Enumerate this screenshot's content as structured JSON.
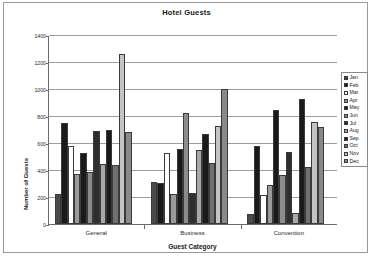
{
  "chart_data": {
    "type": "bar",
    "title": "Hotel Guests",
    "xlabel": "Guest Category",
    "ylabel": "Number of Guests",
    "categories": [
      "General",
      "Business",
      "Convention"
    ],
    "ylim": [
      0,
      1400
    ],
    "yticks": [
      0,
      200,
      400,
      600,
      800,
      1000,
      1200,
      1400
    ],
    "grid": true,
    "legend_position": "right",
    "series": [
      {
        "name": "Jan",
        "color": "#4a4a4a",
        "values": [
          225,
          310,
          75
        ]
      },
      {
        "name": "Feb",
        "color": "#1a1a1a",
        "values": [
          750,
          305,
          580
        ]
      },
      {
        "name": "Mar",
        "color": "#ffffff",
        "values": [
          575,
          525,
          215
        ]
      },
      {
        "name": "Apr",
        "color": "#9a9a9a",
        "values": [
          370,
          225,
          290
        ]
      },
      {
        "name": "May",
        "color": "#1a1a1a",
        "values": [
          525,
          555,
          845
        ]
      },
      {
        "name": "Jun",
        "color": "#8c8c8c",
        "values": [
          385,
          820,
          360
        ]
      },
      {
        "name": "Jul",
        "color": "#2e2e2e",
        "values": [
          690,
          230,
          535
        ]
      },
      {
        "name": "Aug",
        "color": "#a8a8a8",
        "values": [
          445,
          545,
          85
        ]
      },
      {
        "name": "Sep",
        "color": "#1a1a1a",
        "values": [
          700,
          665,
          925
        ]
      },
      {
        "name": "Oct",
        "color": "#707070",
        "values": [
          435,
          450,
          420
        ]
      },
      {
        "name": "Nov",
        "color": "#c4c4c4",
        "values": [
          1260,
          725,
          755
        ]
      },
      {
        "name": "Dec",
        "color": "#8a8a8a",
        "values": [
          680,
          1000,
          720
        ]
      }
    ]
  },
  "legend": {
    "items": [
      "Jan",
      "Feb",
      "Mar",
      "Apr",
      "May",
      "Jun",
      "Jul",
      "Aug",
      "Sep",
      "Oct",
      "Nov",
      "Dec"
    ]
  }
}
